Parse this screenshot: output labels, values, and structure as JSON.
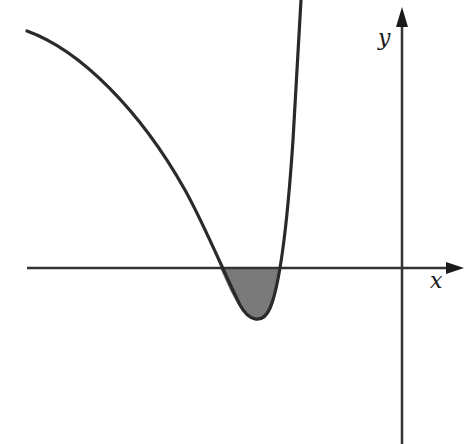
{
  "diagram": {
    "title": "",
    "axes": {
      "x_label": "x",
      "y_label": "y"
    },
    "colors": {
      "background": "#ffffff",
      "curve": "#2a2a2a",
      "axis": "#333333",
      "shaded_region": "#7a7a7a"
    },
    "curve": {
      "points_px": [
        [
          27,
          30
        ],
        [
          100,
          78
        ],
        [
          160,
          148
        ],
        [
          200,
          218
        ],
        [
          220,
          268
        ],
        [
          238,
          300
        ],
        [
          258,
          320
        ],
        [
          270,
          312
        ],
        [
          280,
          268
        ],
        [
          288,
          200
        ],
        [
          296,
          100
        ],
        [
          301,
          0
        ]
      ],
      "x_intercepts_px": [
        220,
        280
      ],
      "minimum_px": [
        258,
        320
      ]
    },
    "shaded_region": {
      "from_x_px": 220,
      "to_x_px": 280,
      "bounded_by": "curve and x-axis"
    }
  }
}
